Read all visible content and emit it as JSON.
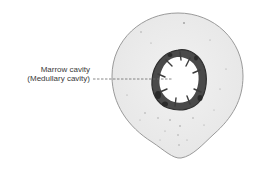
{
  "diagram": {
    "labels": [
      {
        "text": "Marrow cavity"
      },
      {
        "text": "(Medullary cavity)"
      }
    ],
    "colors": {
      "background": "#ffffff",
      "bone_fill": "#ececec",
      "bone_outline": "#9a9a9a",
      "cavity_ring": "#3c3c3c",
      "cavity_fill": "#ffffff",
      "leader_line": "#6a6a6a",
      "label_text": "#3a3a3a"
    }
  }
}
